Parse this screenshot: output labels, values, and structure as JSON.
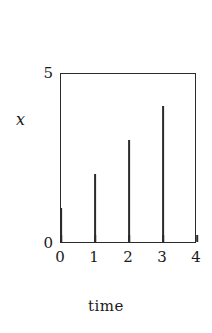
{
  "chart_data": {
    "type": "bar",
    "subtype": "stem-impulse",
    "title": "",
    "xlabel": "time",
    "ylabel": "x",
    "x": [
      0,
      1,
      2,
      3
    ],
    "values": [
      1,
      2,
      3,
      4
    ],
    "categories": [
      "0",
      "1",
      "2",
      "3"
    ],
    "xlim": [
      0,
      4
    ],
    "ylim": [
      0,
      5
    ],
    "xticks": [
      0,
      1,
      2,
      3,
      4
    ],
    "xticklabels": [
      "0",
      "1",
      "2",
      "3",
      "4"
    ],
    "yticks": [
      0,
      5
    ],
    "yticklabels": [
      "0",
      "5"
    ],
    "grid": false,
    "legend": null,
    "series": [
      {
        "name": "x",
        "points": [
          {
            "x": 0,
            "y": 1
          },
          {
            "x": 1,
            "y": 2
          },
          {
            "x": 2,
            "y": 3
          },
          {
            "x": 3,
            "y": 4
          }
        ]
      }
    ]
  },
  "axes": {
    "y_top_label": "5",
    "y_bottom_label": "0",
    "y_title": "x",
    "x_title": "time",
    "x_tick_labels": [
      "0",
      "1",
      "2",
      "3",
      "4"
    ]
  },
  "colors": {
    "line": "#2b2b2b",
    "text": "#1a1a1a",
    "background": "#ffffff"
  }
}
